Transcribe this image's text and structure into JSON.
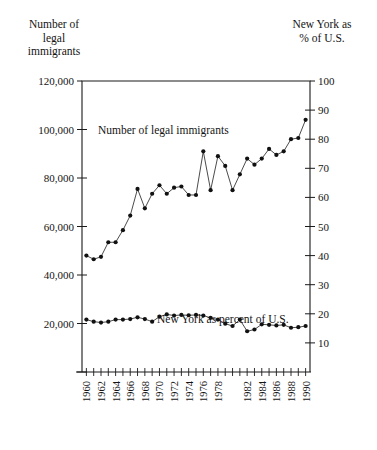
{
  "titles": {
    "left_axis_title": "Number of\nlegal\nimmigrants",
    "left_axis_title_lines": [
      "Number of",
      "legal",
      "immigrants"
    ],
    "right_axis_title_lines": [
      "New York as",
      "% of U.S."
    ]
  },
  "annotations": {
    "upper_series_label": "Number of legal immigrants",
    "lower_series_label": "New York as percent of U.S."
  },
  "chart_data": {
    "type": "line",
    "title": "",
    "subtitle": "",
    "xlabel": "",
    "ylabel": "Number of legal immigrants",
    "y2label": "New York as % of U.S.",
    "grid": false,
    "legend": "inline-annotation",
    "xlim": [
      1959.4,
      1990.6
    ],
    "ylim": [
      0,
      120000
    ],
    "y2lim": [
      0,
      100
    ],
    "yticks": [
      0,
      20000,
      40000,
      60000,
      80000,
      100000,
      120000
    ],
    "ytick_labels": [
      "0",
      "20,000",
      "40,000",
      "60,000",
      "80,000",
      "100,000",
      "120,000"
    ],
    "ytick_labels_shown": [
      "20,000",
      "40,000",
      "60,000",
      "80,000",
      "100,000",
      "120,000"
    ],
    "y2ticks": [
      0,
      10,
      20,
      30,
      40,
      50,
      60,
      70,
      80,
      90,
      100
    ],
    "y2tick_labels": [
      "10",
      "20",
      "30",
      "40",
      "50",
      "60",
      "70",
      "80",
      "90",
      "100"
    ],
    "x": [
      1960,
      1961,
      1962,
      1963,
      1964,
      1965,
      1966,
      1967,
      1968,
      1969,
      1970,
      1971,
      1972,
      1973,
      1974,
      1975,
      1976,
      1977,
      1978,
      1979,
      1980,
      1981,
      1982,
      1983,
      1984,
      1985,
      1986,
      1987,
      1988,
      1989,
      1990
    ],
    "xtick_labels": [
      "1960",
      "1962",
      "1964",
      "1966",
      "1968",
      "1970",
      "1972",
      "1974",
      "1976",
      "1978",
      "1982",
      "1984",
      "1986",
      "1988",
      "1990"
    ],
    "xticks_labeled": [
      1960,
      1962,
      1964,
      1966,
      1968,
      1970,
      1972,
      1974,
      1976,
      1978,
      1982,
      1984,
      1986,
      1988,
      1990
    ],
    "series": [
      {
        "name": "Number of legal immigrants",
        "axis": "left",
        "values": [
          48000,
          46500,
          47500,
          53500,
          53500,
          58500,
          64500,
          75500,
          67500,
          73500,
          77000,
          73500,
          76000,
          76500,
          73000,
          73000,
          91000,
          75000,
          89000,
          85000,
          75000,
          81500,
          88000,
          85500,
          88000,
          92000,
          89500,
          91000,
          96000,
          96500,
          104000
        ]
      },
      {
        "name": "New York as percent of U.S.",
        "axis": "right",
        "values": [
          18.0,
          17.3,
          17.0,
          17.3,
          18.0,
          18.0,
          18.2,
          18.8,
          18.2,
          17.3,
          19.0,
          19.8,
          19.4,
          19.6,
          19.5,
          19.6,
          19.4,
          18.6,
          18.0,
          16.6,
          15.8,
          18.0,
          14.0,
          14.6,
          16.4,
          16.2,
          16.0,
          16.2,
          15.2,
          15.4,
          15.8
        ]
      }
    ]
  }
}
